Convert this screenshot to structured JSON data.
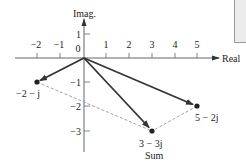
{
  "diagram": {
    "axes": {
      "x_label": "Real",
      "y_label": "Imag.",
      "x_ticks": [
        "−2",
        "−1",
        "0",
        "1",
        "2",
        "3",
        "4",
        "5"
      ],
      "x_tick_values": [
        -2,
        -1,
        0,
        1,
        2,
        3,
        4,
        5
      ],
      "y_ticks": [
        "1",
        "−1",
        "−2",
        "−3"
      ],
      "y_tick_values": [
        1,
        -1,
        -2,
        -3
      ]
    },
    "points": [
      {
        "id": "a",
        "label": "−2 − j",
        "re": -2,
        "im": -1
      },
      {
        "id": "b",
        "label": "5 − 2j",
        "re": 5,
        "im": -2
      },
      {
        "id": "sum",
        "label": "3 − 3j",
        "sublabel": "Sum",
        "re": 3,
        "im": -3
      }
    ],
    "colors": {
      "vector": "#333333",
      "dashed": "#8a8a8a",
      "axis": "#555555"
    }
  }
}
